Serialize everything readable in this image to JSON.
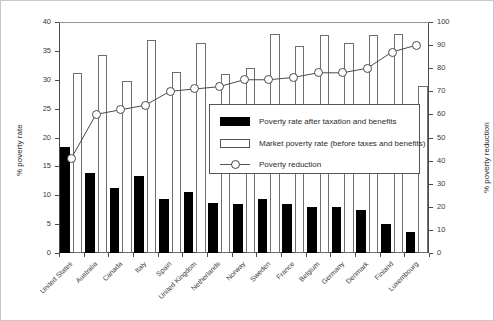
{
  "axes": {
    "left_title": "% poverty rate",
    "right_title": "% poverty reduction",
    "left_ticks": [
      "0",
      "5",
      "10",
      "15",
      "20",
      "25",
      "30",
      "35",
      "40"
    ],
    "right_ticks": [
      "0",
      "10",
      "20",
      "30",
      "40",
      "50",
      "60",
      "70",
      "80",
      "90",
      "100"
    ]
  },
  "legend": {
    "items": [
      {
        "label": "Poverty rate after taxation and benefits",
        "swatch": "black-bar-icon"
      },
      {
        "label": "Market poverty rate (before taxes and benefits)",
        "swatch": "white-bar-icon"
      },
      {
        "label": "Poverty reduction",
        "swatch": "line-marker-icon"
      }
    ]
  },
  "chart_data": {
    "type": "bar",
    "title": "",
    "xlabel": "",
    "ylabel": "% poverty rate",
    "y2label": "% poverty reduction",
    "ylim": [
      0,
      40
    ],
    "y2lim": [
      0,
      100
    ],
    "grid": false,
    "legend_position": "center",
    "categories": [
      "United States",
      "Australia",
      "Canada",
      "Italy",
      "Spain",
      "United Kingdom",
      "Netherlands",
      "Norway",
      "Sweden",
      "France",
      "Belgium",
      "Germany",
      "Denmark",
      "Finland",
      "Luxembourg"
    ],
    "series": [
      {
        "name": "Poverty rate after taxation and benefits",
        "axis": "left",
        "type": "bar",
        "values": [
          18.3,
          13.9,
          11.2,
          13.4,
          9.3,
          10.5,
          8.6,
          8.5,
          9.4,
          8.5,
          8.0,
          7.9,
          7.4,
          5.0,
          3.7
        ]
      },
      {
        "name": "Market poverty rate (before taxes and benefits)",
        "axis": "left",
        "type": "bar",
        "values": [
          31.1,
          34.3,
          29.8,
          36.8,
          31.3,
          36.3,
          31.0,
          32.0,
          37.9,
          35.8,
          37.7,
          36.4,
          37.7,
          38.0,
          29.0
        ]
      },
      {
        "name": "Poverty reduction",
        "axis": "right",
        "type": "line",
        "values": [
          41,
          60,
          62,
          64,
          70,
          71,
          72,
          75,
          75,
          76,
          78,
          78,
          80,
          87,
          90
        ]
      }
    ]
  }
}
